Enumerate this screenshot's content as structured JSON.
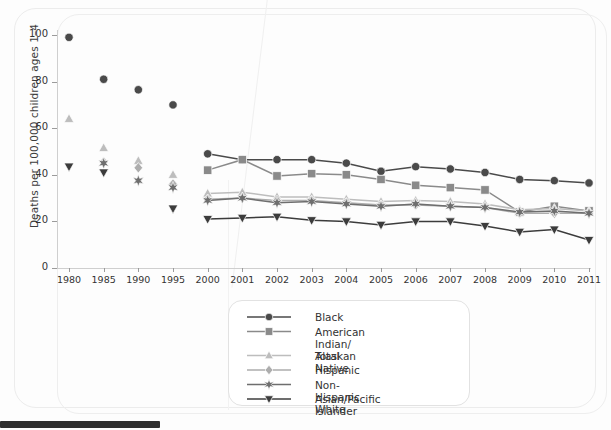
{
  "chart_data": {
    "type": "line",
    "title": "",
    "xlabel": "",
    "ylabel": "Deaths per 100,000 children ages 1–4",
    "ylim": [
      0,
      100
    ],
    "yticks": [
      0,
      20,
      40,
      60,
      80,
      100
    ],
    "grid": false,
    "legend_position": "bottom-center",
    "categories": [
      "1980",
      "1985",
      "1990",
      "1995",
      "2000",
      "2001",
      "2002",
      "2003",
      "2004",
      "2005",
      "2006",
      "2007",
      "2008",
      "2009",
      "2010",
      "2011"
    ],
    "series": [
      {
        "name": "Black",
        "marker": "circle",
        "color": "#4a4a4a",
        "values": [
          99.0,
          81.0,
          76.5,
          70.0,
          49.0,
          46.5,
          46.5,
          46.5,
          45.0,
          41.5,
          43.5,
          42.5,
          41.0,
          38.0,
          37.5,
          36.5
        ]
      },
      {
        "name": "American Indian/\nAlaskan Native",
        "marker": "square",
        "color": "#8a8a8a",
        "values": [
          null,
          null,
          null,
          null,
          42.0,
          46.5,
          39.5,
          40.5,
          40.0,
          38.0,
          35.5,
          34.5,
          33.5,
          24.0,
          26.5,
          24.5
        ]
      },
      {
        "name": "Total",
        "marker": "triangle-up",
        "color": "#bdbdbd",
        "values": [
          64.0,
          51.5,
          46.0,
          40.0,
          32.0,
          32.5,
          30.5,
          30.5,
          29.5,
          28.5,
          29.0,
          28.5,
          27.5,
          25.0,
          25.5,
          24.5
        ]
      },
      {
        "name": "Hispanic",
        "marker": "diamond",
        "color": "#adadad",
        "values": [
          null,
          45.5,
          43.0,
          36.0,
          29.5,
          30.0,
          29.0,
          29.0,
          28.0,
          27.0,
          27.0,
          26.5,
          26.0,
          23.5,
          23.5,
          23.5
        ]
      },
      {
        "name": "Non-Hispanic White",
        "marker": "star",
        "color": "#6e6e6e",
        "values": [
          null,
          45.0,
          37.5,
          34.5,
          29.0,
          30.0,
          28.0,
          28.5,
          27.5,
          26.5,
          27.5,
          26.5,
          26.0,
          24.0,
          24.5,
          23.5
        ]
      },
      {
        "name": "Asian/Pacific Islander",
        "marker": "triangle-down",
        "color": "#3c3c3c",
        "values": [
          43.5,
          41.0,
          null,
          25.5,
          21.0,
          21.5,
          22.0,
          20.5,
          20.0,
          18.5,
          20.0,
          20.0,
          18.0,
          15.5,
          16.5,
          12.0
        ]
      }
    ],
    "connected_from": "2000"
  },
  "legend": {
    "title": "",
    "items": [
      {
        "label": "Black",
        "color": "#4a4a4a",
        "marker": "circle"
      },
      {
        "label": "American Indian/\nAlaskan Native",
        "color": "#8a8a8a",
        "marker": "square"
      },
      {
        "label": "Total",
        "color": "#bdbdbd",
        "marker": "triangle-up"
      },
      {
        "label": "Hispanic",
        "color": "#adadad",
        "marker": "diamond"
      },
      {
        "label": "Non-Hispanic White",
        "color": "#6e6e6e",
        "marker": "star"
      },
      {
        "label": "Asian/Pacific Islander",
        "color": "#3c3c3c",
        "marker": "triangle-down"
      }
    ]
  },
  "axes": {
    "y_label": "Deaths per 100,000 children ages 1–4",
    "y_ticks": [
      "0",
      "20",
      "40",
      "60",
      "80",
      "100"
    ],
    "x_ticks": [
      "1980",
      "1985",
      "1990",
      "1995",
      "2000",
      "2001",
      "2002",
      "2003",
      "2004",
      "2005",
      "2006",
      "2007",
      "2008",
      "2009",
      "2010",
      "2011"
    ]
  }
}
